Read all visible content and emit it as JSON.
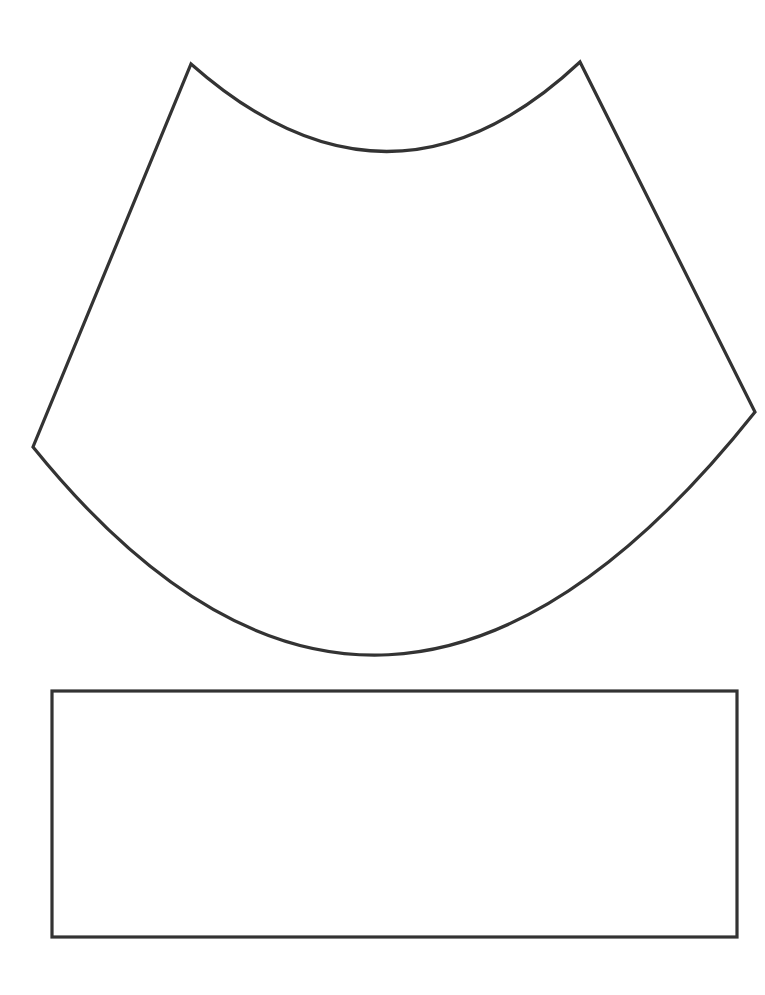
{
  "page": {
    "width": 765,
    "height": 995,
    "background": "#ffffff"
  },
  "style": {
    "stroke_color": "#333333",
    "stroke_width": 3.2,
    "fill_color": "#ffffff"
  },
  "shapes": {
    "cone_net": {
      "type": "annular-sector",
      "top_left": [
        191,
        64
      ],
      "top_right": [
        580,
        62
      ],
      "inner_arc_low_point": [
        390,
        151
      ],
      "right_point": [
        755,
        412
      ],
      "left_point": [
        33,
        447
      ],
      "outer_arc_low_point": [
        380,
        645
      ],
      "path": "M 191 64 Q 390 240 580 62 L 755 412 Q 383 880 33 447 Z"
    },
    "base_rectangle": {
      "type": "rectangle",
      "x": 52,
      "y": 691,
      "width": 685,
      "height": 246
    }
  }
}
